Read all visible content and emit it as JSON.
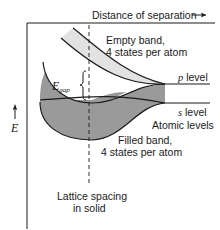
{
  "diagram": {
    "x_axis_label": "Distance of separation",
    "x_axis_arrow": "→",
    "y_axis_label": "E",
    "y_axis_arrow": "↑",
    "empty_band_label_line1": "Empty band,",
    "empty_band_label_line2": "4 states per atom",
    "p_level_symbol": "p",
    "p_level_text": "level",
    "s_level_symbol": "s",
    "s_level_text": "level",
    "atomic_levels_label": "Atomic levels",
    "filled_band_label_line1": "Filled band,",
    "filled_band_label_line2": "4 states per atom",
    "gap_label_main": "E",
    "gap_label_sub": "gap",
    "lattice_label_line1": "Lattice spacing",
    "lattice_label_line2": "in solid",
    "colors": {
      "empty_band_fill": "#e2e2e2",
      "filled_band_fill": "#9a9a9a",
      "line": "#1a1a1a"
    }
  }
}
